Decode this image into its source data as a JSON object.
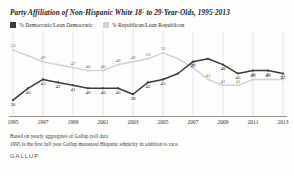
{
  "chart": {
    "title": "Party Affiliation of Non-Hispanic White 18- to 29-Year-Olds, 1995-2013",
    "legend": {
      "dem_label": "% Democratic/Lean Democratic",
      "rep_label": "% Republican/Lean Republican",
      "dem_color": "#3c3c3c",
      "rep_color": "#d2d2d2"
    },
    "footnote_1": "Based on yearly aggregates of Gallup poll data",
    "footnote_2": "1995 is the first full year Gallup measured Hispanic ethnicity in addition to race.",
    "brand": "GALLUP"
  },
  "chart_data": {
    "type": "line",
    "title": "Party Affiliation of Non-Hispanic White 18- to 29-Year-Olds, 1995-2013",
    "xlabel": "",
    "ylabel": "",
    "ylim": [
      33,
      56
    ],
    "grid": true,
    "legend_position": "top-left",
    "x": [
      1995,
      1996,
      1997,
      1998,
      1999,
      2000,
      2001,
      2002,
      2003,
      2004,
      2005,
      2006,
      2007,
      2008,
      2009,
      2010,
      2011,
      2012,
      2013
    ],
    "tick_labels": [
      "1995",
      "1997",
      "1999",
      "2001",
      "2003",
      "2005",
      "2007",
      "2009",
      "2011",
      "2013"
    ],
    "tick_values": [
      1995,
      1997,
      1999,
      2001,
      2003,
      2005,
      2007,
      2009,
      2011,
      2013
    ],
    "series": [
      {
        "name": "% Republican/Lean Republican",
        "color": "#d2d2d2",
        "values": [
          53,
          51,
          49,
          48,
          47,
          46,
          46,
          48,
          49,
          50,
          52,
          50,
          47,
          43,
          41,
          41,
          43,
          43,
          43
        ],
        "labels": [
          "53",
          "",
          "49",
          "",
          "47",
          "46",
          "46",
          "48",
          "49",
          "50",
          "52",
          "",
          "47",
          "43",
          "41",
          "41",
          "43",
          "43",
          "43"
        ]
      },
      {
        "name": "% Democratic/Lean Democratic",
        "color": "#3c3c3c",
        "values": [
          36,
          40,
          43,
          42,
          41,
          40,
          40,
          40,
          38,
          42,
          43,
          45,
          49,
          50,
          48,
          45,
          46,
          46,
          45
        ],
        "labels": [
          "36",
          "40",
          "43",
          "42",
          "41",
          "40",
          "40",
          "40",
          "38",
          "42",
          "43",
          "",
          "49",
          "",
          "48",
          "45",
          "46",
          "46",
          "45"
        ]
      }
    ]
  }
}
